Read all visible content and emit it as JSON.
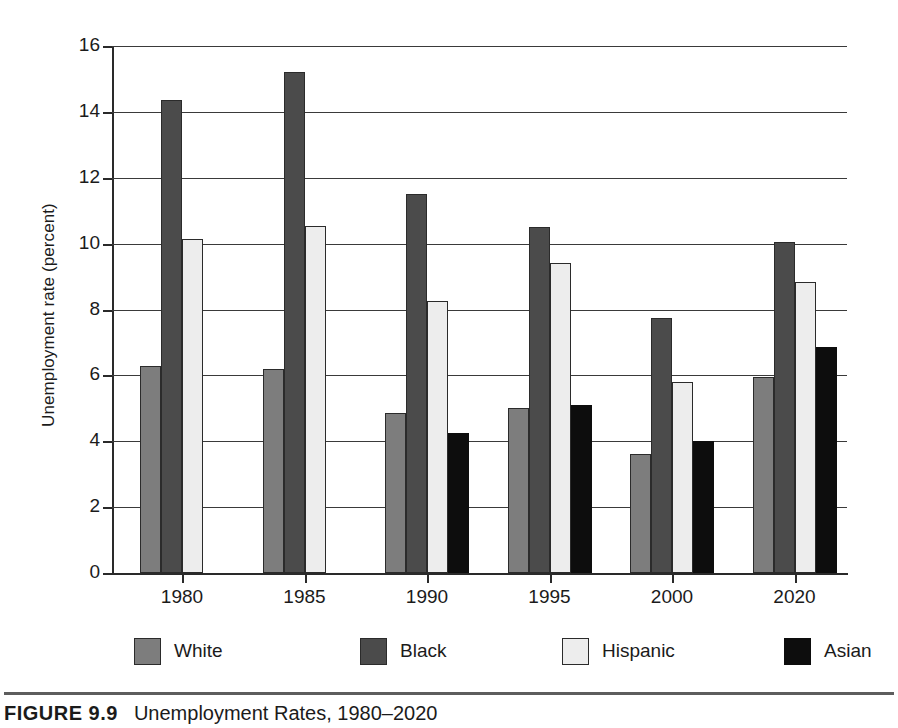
{
  "figure": {
    "caption_number": "FIGURE 9.9",
    "caption_title": "Unemployment Rates, 1980–2020"
  },
  "axes": {
    "ylabel": "Unemployment rate (percent)",
    "xlabel": "",
    "yticks": [
      "0",
      "2",
      "4",
      "6",
      "8",
      "10",
      "12",
      "14",
      "16"
    ]
  },
  "legend": {
    "items": [
      {
        "label": "White",
        "color": "#7d7d7d"
      },
      {
        "label": "Black",
        "color": "#4b4b4b"
      },
      {
        "label": "Hispanic",
        "color": "#ededed"
      },
      {
        "label": "Asian",
        "color": "#0d0d0d"
      }
    ]
  },
  "chart_data": {
    "type": "bar",
    "title": "Unemployment Rates, 1980–2020",
    "xlabel": "",
    "ylabel": "Unemployment rate (percent)",
    "ylim": [
      0,
      16
    ],
    "ytick_step": 2,
    "grid": true,
    "legend_position": "bottom",
    "categories": [
      "1980",
      "1985",
      "1990",
      "1995",
      "2000",
      "2020"
    ],
    "series": [
      {
        "name": "White",
        "color": "#7d7d7d",
        "values": [
          6.3,
          6.2,
          4.85,
          5.0,
          3.6,
          5.95
        ]
      },
      {
        "name": "Black",
        "color": "#4b4b4b",
        "values": [
          14.35,
          15.2,
          11.5,
          10.5,
          7.75,
          10.05
        ]
      },
      {
        "name": "Hispanic",
        "color": "#ededed",
        "values": [
          10.15,
          10.55,
          8.25,
          9.4,
          5.8,
          8.85
        ]
      },
      {
        "name": "Asian",
        "color": "#0d0d0d",
        "values": [
          null,
          null,
          4.25,
          5.1,
          4.0,
          6.85
        ]
      }
    ]
  }
}
